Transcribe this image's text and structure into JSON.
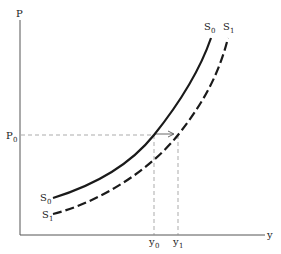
{
  "diagram": {
    "type": "supply-shift",
    "axes": {
      "y_label": "P",
      "x_label": "y"
    },
    "price_level": {
      "label": "P",
      "subscript": "0"
    },
    "curves": [
      {
        "name": "S",
        "subscript": "0",
        "style": "solid",
        "low_label": "S",
        "low_sub": "0"
      },
      {
        "name": "S",
        "subscript": "1",
        "style": "dashed",
        "low_label": "S",
        "low_sub": "1"
      }
    ],
    "quantities": [
      {
        "label": "y",
        "subscript": "0"
      },
      {
        "label": "y",
        "subscript": "1"
      }
    ],
    "arrow": {
      "from": "y0",
      "to": "y1",
      "direction": "right"
    },
    "colors": {
      "curve": "#1a1a1a",
      "axis": "#555555",
      "guide": "#888888"
    }
  }
}
